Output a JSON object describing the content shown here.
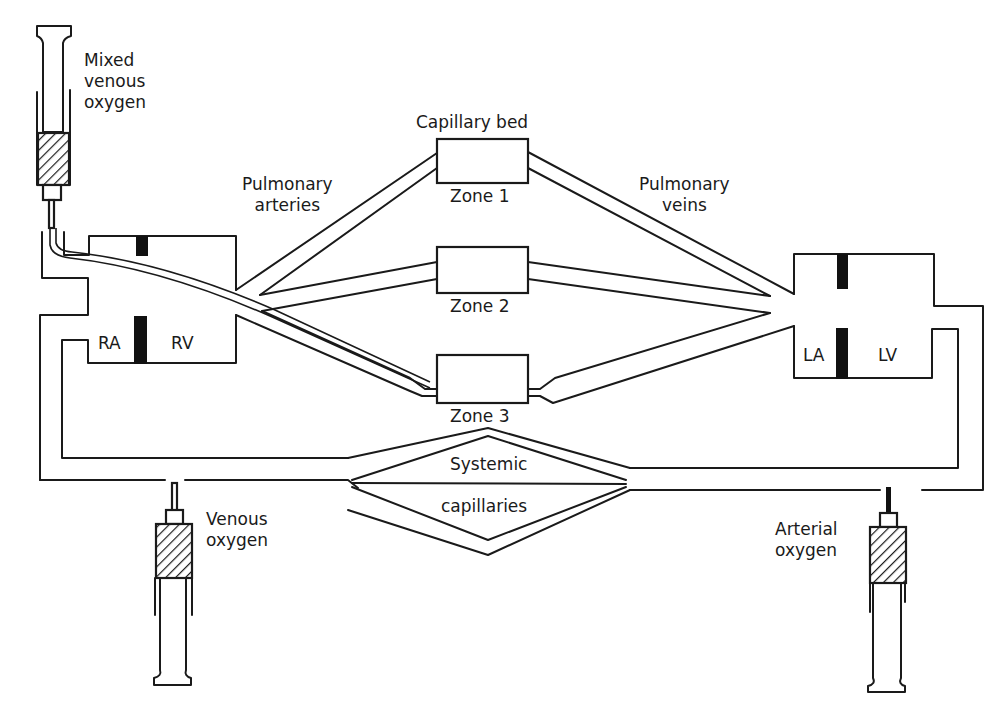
{
  "figure": {
    "labels": {
      "mixed_venous": [
        "Mixed",
        "venous",
        "oxygen"
      ],
      "capillary_bed": "Capillary bed",
      "pulmonary_arteries": [
        "Pulmonary",
        "arteries"
      ],
      "pulmonary_veins": [
        "Pulmonary",
        "veins"
      ],
      "zone1": "Zone 1",
      "zone2": "Zone 2",
      "zone3": "Zone 3",
      "ra": "RA",
      "rv": "RV",
      "la": "LA",
      "lv": "LV",
      "systemic": "Systemic",
      "capillaries": "capillaries",
      "venous_oxygen": [
        "Venous",
        "oxygen"
      ],
      "arterial_oxygen": [
        "Arterial",
        "oxygen"
      ]
    },
    "colors": {
      "line": "#1a1a1a",
      "background": "#ffffff"
    }
  }
}
